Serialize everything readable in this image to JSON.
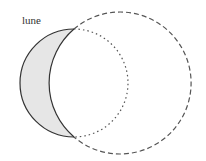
{
  "diagram": {
    "label": "lune",
    "colors": {
      "lune_fill": "#e6e6e6",
      "stroke": "#333333",
      "dashed_stroke": "#555555"
    },
    "elements": [
      {
        "name": "lune-region",
        "description": "shaded crescent between the circles"
      },
      {
        "name": "small-circle-hidden-arc",
        "style": "dotted"
      },
      {
        "name": "large-circle-outer-arc",
        "style": "dashed"
      }
    ]
  }
}
